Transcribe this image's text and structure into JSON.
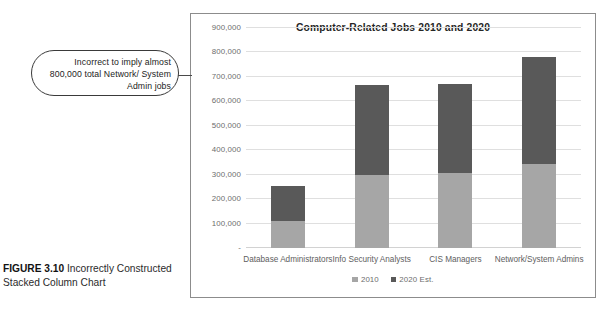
{
  "callout": {
    "text": "Incorrect to imply almost 800,000 total Network/ System Admin jobs"
  },
  "caption": {
    "label": "FIGURE 3.10",
    "text": " Incorrectly Constructed Stacked Column Chart"
  },
  "chart_data": {
    "type": "bar",
    "subtype": "stacked-column",
    "title": "Computer-Related Jobs 2010 and 2020",
    "xlabel": "",
    "ylabel": "",
    "ylim": [
      0,
      900000
    ],
    "ytick_labels": [
      "900,000",
      "800,000",
      "700,000",
      "600,000",
      "500,000",
      "400,000",
      "300,000",
      "200,000",
      "100,000",
      "-"
    ],
    "ytick_values": [
      900000,
      800000,
      700000,
      600000,
      500000,
      400000,
      300000,
      200000,
      100000,
      0
    ],
    "grid": true,
    "legend_position": "bottom",
    "categories": [
      "Database Administrators",
      "Info Security Analysts",
      "CIS Managers",
      "Network/System Admins"
    ],
    "series": [
      {
        "name": "2010",
        "color": "#a6a6a6",
        "values": [
          110000,
          300000,
          305000,
          345000
        ]
      },
      {
        "name": "2020 Est.",
        "color": "#595959",
        "values": [
          145000,
          368000,
          365000,
          438000
        ]
      }
    ],
    "totals": [
      255000,
      668000,
      670000,
      783000
    ]
  }
}
